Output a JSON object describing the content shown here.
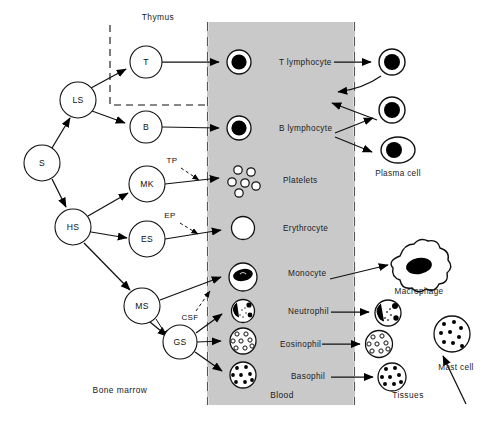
{
  "figure": {
    "title_regions": {
      "thymus": "Thymus",
      "bone_marrow": "Bone marrow",
      "blood": "Blood",
      "tissues": "Tissues"
    },
    "colors": {
      "blood_band_fill": "#c9c9c9",
      "line": "#000000",
      "nucleus": "#000000",
      "background": "#ffffff"
    }
  },
  "stem_nodes": [
    {
      "id": "S",
      "label": "S",
      "cx": 42,
      "cy": 163,
      "r": 18
    },
    {
      "id": "LS",
      "label": "LS",
      "cx": 78,
      "cy": 100,
      "r": 18
    },
    {
      "id": "HS",
      "label": "HS",
      "cx": 73,
      "cy": 227,
      "r": 18
    },
    {
      "id": "T",
      "label": "T",
      "cx": 146,
      "cy": 62,
      "r": 16
    },
    {
      "id": "B",
      "label": "B",
      "cx": 146,
      "cy": 127,
      "r": 16
    },
    {
      "id": "MK",
      "label": "MK",
      "cx": 147,
      "cy": 184,
      "r": 18
    },
    {
      "id": "ES",
      "label": "ES",
      "cx": 147,
      "cy": 239,
      "r": 18
    },
    {
      "id": "MS",
      "label": "MS",
      "cx": 142,
      "cy": 306,
      "r": 18
    },
    {
      "id": "GS",
      "label": "GS",
      "cx": 180,
      "cy": 342,
      "r": 17
    }
  ],
  "growth_factors": [
    {
      "id": "TP",
      "label": "TP",
      "x": 172,
      "y": 163
    },
    {
      "id": "EP",
      "label": "EP",
      "x": 170,
      "y": 218
    },
    {
      "id": "CSF",
      "label": "CSF",
      "x": 176,
      "y": 317
    }
  ],
  "blood_cells": [
    {
      "id": "t-lymphocyte",
      "label": "T lymphocyte",
      "cx": 239,
      "cy": 62,
      "label_x": 279,
      "label_y": 65
    },
    {
      "id": "b-lymphocyte",
      "label": "B lymphocyte",
      "cx": 239,
      "cy": 128,
      "label_x": 279,
      "label_y": 131
    },
    {
      "id": "platelets",
      "label": "Platelets",
      "cx": 243,
      "cy": 180,
      "label_x": 283,
      "label_y": 183
    },
    {
      "id": "erythrocyte",
      "label": "Erythrocyte",
      "cx": 243,
      "cy": 228,
      "label_x": 283,
      "label_y": 231
    },
    {
      "id": "monocyte",
      "label": "Monocyte",
      "cx": 243,
      "cy": 277,
      "label_x": 289,
      "label_y": 275
    },
    {
      "id": "neutrophil",
      "label": "Neutrophil",
      "cx": 243,
      "cy": 311,
      "label_x": 289,
      "label_y": 313
    },
    {
      "id": "eosinophil",
      "label": "Eosinophil",
      "cx": 243,
      "cy": 341,
      "label_x": 285,
      "label_y": 344
    },
    {
      "id": "basophil",
      "label": "Basophil",
      "cx": 243,
      "cy": 375,
      "label_x": 289,
      "label_y": 378
    }
  ],
  "tissue_cells": [
    {
      "id": "t-lymphocyte-tissue",
      "label": "",
      "cx": 392,
      "cy": 62
    },
    {
      "id": "b-lymphocyte-tissue",
      "label": "",
      "cx": 392,
      "cy": 110
    },
    {
      "id": "plasma-cell",
      "label": "Plasma cell",
      "cx": 398,
      "cy": 148,
      "label_x": 408,
      "label_y": 176
    },
    {
      "id": "macrophage",
      "label": "Macrophage",
      "cx": 419,
      "cy": 268,
      "label_x": 419,
      "label_y": 293
    },
    {
      "id": "neutrophil-tissue",
      "label": "",
      "cx": 388,
      "cy": 313
    },
    {
      "id": "eosinophil-tissue",
      "label": "",
      "cx": 379,
      "cy": 344
    },
    {
      "id": "basophil-tissue",
      "label": "",
      "cx": 392,
      "cy": 377
    },
    {
      "id": "mast-cell",
      "label": "Mast cell",
      "cx": 452,
      "cy": 334,
      "label_x": 452,
      "label_y": 368
    }
  ],
  "region_labels": [
    {
      "id": "thymus",
      "text": "Thymus",
      "x": 158,
      "y": 20
    },
    {
      "id": "bone-marrow",
      "text": "Bone marrow",
      "x": 120,
      "y": 393
    },
    {
      "id": "blood",
      "text": "Blood",
      "x": 282,
      "y": 397
    },
    {
      "id": "tissues",
      "text": "Tissues",
      "x": 404,
      "y": 397
    }
  ],
  "thymus_box": {
    "x": 110,
    "y": 25,
    "width": 97,
    "height": 80
  },
  "blood_band": {
    "x": 207,
    "y": 22,
    "width": 148,
    "height": 383
  }
}
